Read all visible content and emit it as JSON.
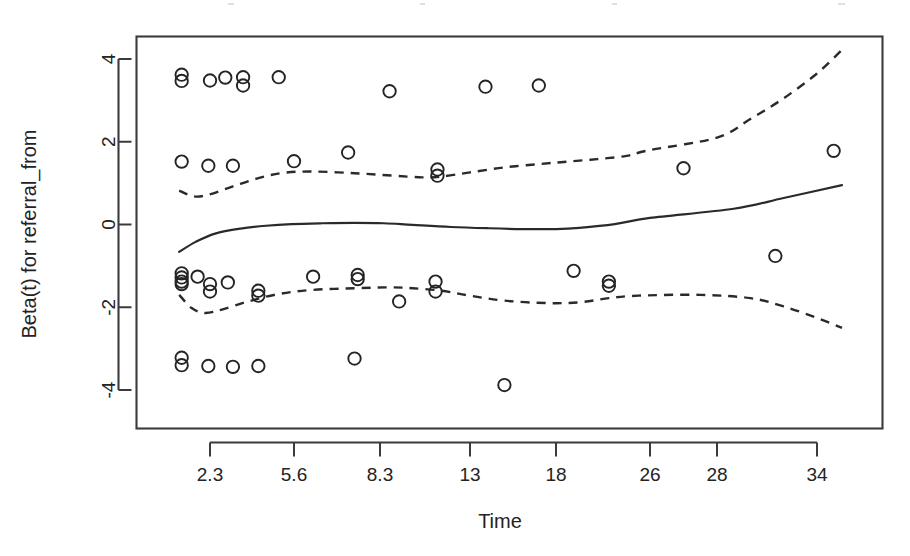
{
  "figure": {
    "background_color": "#ffffff",
    "ink_color": "#242424"
  },
  "chart_data": {
    "type": "scatter",
    "title": "",
    "xlabel": "Time",
    "ylabel": "Beta(t) for referral_from",
    "grid": false,
    "legend": "none",
    "xlim": [
      0,
      36
    ],
    "ylim": [
      -4.6,
      4.5
    ],
    "x_ticks": [
      "2.3",
      "5.6",
      "8.3",
      "13",
      "18",
      "26",
      "28",
      "34"
    ],
    "x_tick_positions": [
      2.3,
      5.6,
      8.3,
      13,
      18,
      26,
      28,
      34
    ],
    "y_ticks": [
      "4",
      "2",
      "0",
      "-2",
      "-4"
    ],
    "y_tick_positions": [
      4,
      2,
      0,
      -2,
      -4
    ],
    "series": [
      {
        "name": "Scaled Schoenfeld residuals",
        "type": "scatter",
        "marker": "open-circle",
        "points": [
          [
            0.85,
            3.62
          ],
          [
            0.85,
            3.47
          ],
          [
            2.3,
            3.48
          ],
          [
            2.9,
            3.55
          ],
          [
            3.6,
            3.56
          ],
          [
            3.6,
            3.36
          ],
          [
            5.0,
            3.56
          ],
          [
            8.8,
            3.22
          ],
          [
            13.9,
            3.33
          ],
          [
            17.0,
            3.36
          ],
          [
            0.85,
            1.52
          ],
          [
            2.2,
            1.42
          ],
          [
            3.2,
            1.42
          ],
          [
            5.6,
            1.53
          ],
          [
            7.3,
            1.74
          ],
          [
            11.3,
            1.33
          ],
          [
            11.3,
            1.18
          ],
          [
            27.0,
            1.36
          ],
          [
            35.0,
            1.78
          ],
          [
            0.85,
            -1.18
          ],
          [
            0.85,
            -1.28
          ],
          [
            0.85,
            -1.38
          ],
          [
            0.85,
            -1.44
          ],
          [
            1.6,
            -1.26
          ],
          [
            2.3,
            -1.44
          ],
          [
            2.3,
            -1.62
          ],
          [
            3.0,
            -1.4
          ],
          [
            4.2,
            -1.6
          ],
          [
            4.2,
            -1.72
          ],
          [
            6.2,
            -1.26
          ],
          [
            7.6,
            -1.22
          ],
          [
            7.6,
            -1.32
          ],
          [
            9.3,
            -1.86
          ],
          [
            11.2,
            -1.38
          ],
          [
            11.2,
            -1.62
          ],
          [
            19.5,
            -1.12
          ],
          [
            22.5,
            -1.38
          ],
          [
            22.5,
            -1.48
          ],
          [
            31.5,
            -0.76
          ],
          [
            0.85,
            -3.22
          ],
          [
            0.85,
            -3.4
          ],
          [
            2.2,
            -3.42
          ],
          [
            3.2,
            -3.44
          ],
          [
            4.2,
            -3.42
          ],
          [
            7.5,
            -3.24
          ],
          [
            15.0,
            -3.88
          ]
        ]
      },
      {
        "name": "Smoothed Beta(t) estimate",
        "type": "line",
        "style": "solid",
        "points": [
          [
            0.75,
            -0.66
          ],
          [
            1.5,
            -0.42
          ],
          [
            2.5,
            -0.22
          ],
          [
            3.5,
            -0.1
          ],
          [
            4.5,
            -0.03
          ],
          [
            5.5,
            0.01
          ],
          [
            6.5,
            0.03
          ],
          [
            7.5,
            0.04
          ],
          [
            8.5,
            0.03
          ],
          [
            10.0,
            -0.01
          ],
          [
            12.0,
            -0.06
          ],
          [
            14.0,
            -0.09
          ],
          [
            16.0,
            -0.11
          ],
          [
            18.0,
            -0.11
          ],
          [
            20.0,
            -0.08
          ],
          [
            23.0,
            0.01
          ],
          [
            26.0,
            0.16
          ],
          [
            29.0,
            0.38
          ],
          [
            32.0,
            0.64
          ],
          [
            35.5,
            0.95
          ]
        ]
      },
      {
        "name": "Upper 95% confidence band",
        "type": "line",
        "style": "dashed",
        "points": [
          [
            0.75,
            0.82
          ],
          [
            1.4,
            0.68
          ],
          [
            2.2,
            0.72
          ],
          [
            3.2,
            0.92
          ],
          [
            4.2,
            1.12
          ],
          [
            5.2,
            1.25
          ],
          [
            6.2,
            1.28
          ],
          [
            7.5,
            1.24
          ],
          [
            9.0,
            1.18
          ],
          [
            10.5,
            1.14
          ],
          [
            11.5,
            1.16
          ],
          [
            13.0,
            1.26
          ],
          [
            15.0,
            1.38
          ],
          [
            17.0,
            1.46
          ],
          [
            19.0,
            1.52
          ],
          [
            21.5,
            1.58
          ],
          [
            24.0,
            1.66
          ],
          [
            26.0,
            1.8
          ],
          [
            28.0,
            2.1
          ],
          [
            30.0,
            2.55
          ],
          [
            32.0,
            3.05
          ],
          [
            34.0,
            3.65
          ],
          [
            35.5,
            4.22
          ]
        ]
      },
      {
        "name": "Lower 95% confidence band",
        "type": "line",
        "style": "dashed",
        "points": [
          [
            0.75,
            -1.7
          ],
          [
            1.3,
            -2.02
          ],
          [
            2.0,
            -2.14
          ],
          [
            2.8,
            -2.05
          ],
          [
            3.8,
            -1.86
          ],
          [
            5.0,
            -1.68
          ],
          [
            6.2,
            -1.58
          ],
          [
            7.5,
            -1.54
          ],
          [
            8.8,
            -1.52
          ],
          [
            10.0,
            -1.54
          ],
          [
            11.5,
            -1.6
          ],
          [
            13.0,
            -1.72
          ],
          [
            15.0,
            -1.84
          ],
          [
            17.5,
            -1.9
          ],
          [
            20.0,
            -1.88
          ],
          [
            22.5,
            -1.78
          ],
          [
            25.0,
            -1.72
          ],
          [
            27.5,
            -1.7
          ],
          [
            30.0,
            -1.78
          ],
          [
            32.0,
            -1.98
          ],
          [
            34.0,
            -2.26
          ],
          [
            35.5,
            -2.5
          ]
        ]
      }
    ]
  }
}
